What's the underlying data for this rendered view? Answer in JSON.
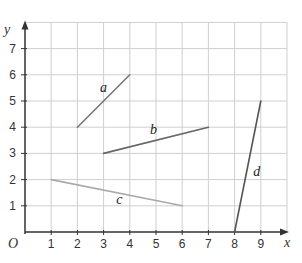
{
  "chart_data": {
    "type": "line",
    "title": "",
    "xlabel": "x",
    "ylabel": "y",
    "origin_label": "O",
    "xlim": [
      0,
      10
    ],
    "ylim": [
      0,
      8
    ],
    "x_ticks": [
      1,
      2,
      3,
      4,
      5,
      6,
      7,
      8,
      9
    ],
    "y_ticks": [
      1,
      2,
      3,
      4,
      5,
      6,
      7
    ],
    "grid": true,
    "series": [
      {
        "name": "a",
        "points": [
          [
            2,
            4
          ],
          [
            4,
            6
          ]
        ],
        "color": "#777777",
        "label_pos": [
          3.0,
          5.35
        ]
      },
      {
        "name": "b",
        "points": [
          [
            3,
            3
          ],
          [
            7,
            4
          ]
        ],
        "color": "#666666",
        "label_pos": [
          4.9,
          3.75
        ]
      },
      {
        "name": "c",
        "points": [
          [
            1,
            2
          ],
          [
            6,
            1
          ]
        ],
        "color": "#aaaaaa",
        "label_pos": [
          3.6,
          1.05
        ]
      },
      {
        "name": "d",
        "points": [
          [
            8,
            0
          ],
          [
            9,
            5
          ]
        ],
        "color": "#555555",
        "label_pos": [
          8.85,
          2.15
        ]
      }
    ]
  },
  "colors": {
    "grid": "#cfcfcf",
    "axis": "#333333",
    "background": "#ffffff"
  }
}
